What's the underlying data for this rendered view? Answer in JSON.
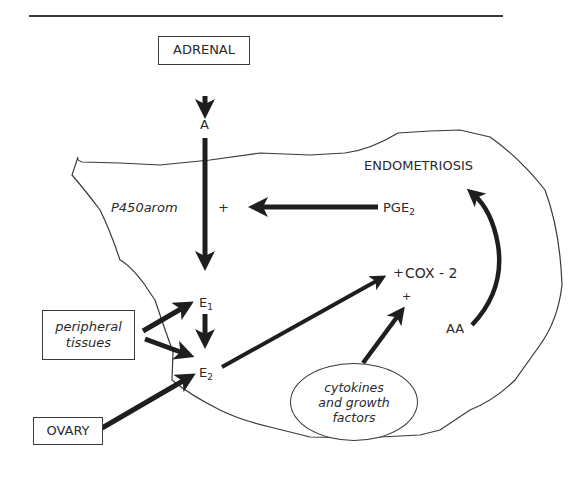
{
  "diagram": {
    "region_label": "ENDOMETRIOSIS",
    "boxes": {
      "adrenal": "ADRENAL",
      "ovary": "OVARY",
      "peripheral_line1": "peripheral",
      "peripheral_line2": "tissues"
    },
    "oval": {
      "line1": "cytokines",
      "line2": "and growth",
      "line3": "factors"
    },
    "nodes": {
      "a": "A",
      "e1_base": "E",
      "e1_sub": "1",
      "e2_base": "E",
      "e2_sub": "2",
      "pge2_base": "PGE",
      "pge2_sub": "2",
      "cox2": "COX - 2",
      "aa": "AA",
      "enzyme": "P450arom"
    },
    "signs": {
      "plus_aromatase": "+",
      "plus_cox2_left": "+",
      "plus_cox2_below": "+"
    },
    "colors": {
      "arrow": "#1e1e1e",
      "outline": "#3a3a3a",
      "text": "#2a2a2a"
    }
  }
}
